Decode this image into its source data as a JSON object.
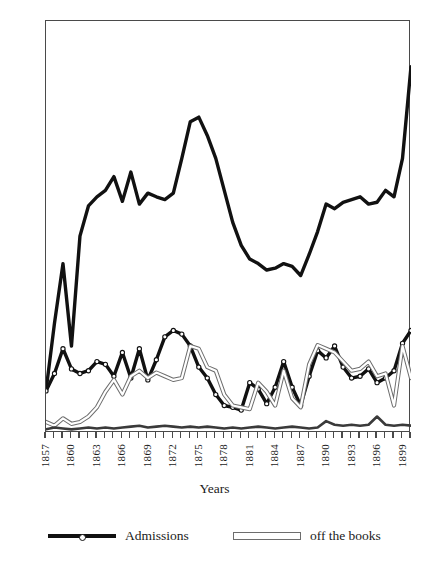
{
  "chart": {
    "type": "line",
    "title": "",
    "xlabel": "Years",
    "ylabel": ""
  },
  "axes": {
    "y_ticks": [
      0,
      50,
      100,
      150,
      200,
      250,
      300,
      350,
      400,
      450
    ],
    "ylim": [
      0,
      450
    ],
    "x_labels": [
      "1857",
      "1860",
      "1863",
      "1866",
      "1869",
      "1872",
      "1875",
      "1878",
      "1881",
      "1884",
      "1887",
      "1890",
      "1893",
      "1896",
      "1899"
    ],
    "x_label_years": [
      1857,
      1860,
      1863,
      1866,
      1869,
      1872,
      1875,
      1878,
      1881,
      1884,
      1887,
      1890,
      1893,
      1896,
      1899
    ],
    "xlim": [
      1857,
      1900
    ],
    "grid": false
  },
  "legend": {
    "position": "bottom",
    "entries": [
      {
        "label": "Admissions",
        "style": "thick-black-line-open-circle-markers",
        "color": "#111111"
      },
      {
        "label": "off the books",
        "style": "thin-hollow-outline-line",
        "color": "#6d6d6d"
      }
    ]
  },
  "chart_data": {
    "type": "line",
    "title": "",
    "xlabel": "Years",
    "ylabel": "",
    "ylim": [
      0,
      450
    ],
    "xlim": [
      1857,
      1900
    ],
    "grid": false,
    "legend_position": "bottom",
    "x": [
      1857,
      1858,
      1859,
      1860,
      1861,
      1862,
      1863,
      1864,
      1865,
      1866,
      1867,
      1868,
      1869,
      1870,
      1871,
      1872,
      1873,
      1874,
      1875,
      1876,
      1877,
      1878,
      1879,
      1880,
      1881,
      1882,
      1883,
      1884,
      1885,
      1886,
      1887,
      1888,
      1889,
      1890,
      1891,
      1892,
      1893,
      1894,
      1895,
      1896,
      1897,
      1898,
      1899,
      1900
    ],
    "categories": [
      "1857",
      "1858",
      "1859",
      "1860",
      "1861",
      "1862",
      "1863",
      "1864",
      "1865",
      "1866",
      "1867",
      "1868",
      "1869",
      "1870",
      "1871",
      "1872",
      "1873",
      "1874",
      "1875",
      "1876",
      "1877",
      "1878",
      "1879",
      "1880",
      "1881",
      "1882",
      "1883",
      "1884",
      "1885",
      "1886",
      "1887",
      "1888",
      "1889",
      "1890",
      "1891",
      "1892",
      "1893",
      "1894",
      "1895",
      "1896",
      "1897",
      "1898",
      "1899",
      "1900"
    ],
    "series": [
      {
        "name": "Total resident population",
        "style": "thick-black-line",
        "color": "#111111",
        "markers": false,
        "values": [
          46,
          120,
          185,
          95,
          215,
          248,
          258,
          265,
          280,
          253,
          285,
          250,
          262,
          258,
          255,
          262,
          300,
          340,
          345,
          325,
          300,
          265,
          230,
          205,
          190,
          185,
          178,
          180,
          185,
          182,
          172,
          195,
          220,
          250,
          245,
          252,
          255,
          258,
          250,
          252,
          265,
          258,
          300,
          400
        ]
      },
      {
        "name": "Admissions",
        "style": "thick-black-line-open-circle-markers",
        "color": "#111111",
        "markers": true,
        "values": [
          46,
          65,
          92,
          70,
          65,
          68,
          78,
          75,
          62,
          88,
          60,
          92,
          58,
          80,
          105,
          112,
          108,
          95,
          72,
          60,
          42,
          30,
          28,
          25,
          55,
          48,
          32,
          50,
          78,
          50,
          30,
          62,
          90,
          82,
          95,
          72,
          60,
          62,
          70,
          55,
          60,
          68,
          98,
          112
        ]
      },
      {
        "name": "off the books",
        "style": "thin-hollow-outline-line",
        "color": "#6d6d6d",
        "markers": false,
        "values": [
          12,
          8,
          16,
          10,
          12,
          18,
          28,
          45,
          58,
          42,
          62,
          68,
          60,
          66,
          62,
          58,
          60,
          95,
          92,
          72,
          68,
          42,
          30,
          28,
          26,
          55,
          45,
          30,
          68,
          38,
          28,
          75,
          96,
          92,
          88,
          78,
          68,
          70,
          78,
          62,
          65,
          30,
          95,
          60
        ]
      },
      {
        "name": "Deaths",
        "style": "medium-dark-line",
        "color": "#3a3a3a",
        "markers": false,
        "values": [
          4,
          6,
          5,
          4,
          5,
          6,
          5,
          6,
          5,
          6,
          7,
          8,
          6,
          7,
          8,
          7,
          6,
          7,
          6,
          7,
          6,
          5,
          6,
          5,
          6,
          7,
          6,
          5,
          6,
          7,
          6,
          5,
          6,
          13,
          9,
          8,
          9,
          8,
          9,
          18,
          9,
          8,
          9,
          8
        ]
      }
    ]
  }
}
